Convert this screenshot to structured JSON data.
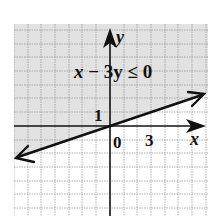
{
  "graph": {
    "inequality": "x − 3y ≤ 0",
    "inequality_parts": {
      "x": "x",
      "minus": "−",
      "three_y": "3y",
      "leq": "≤",
      "zero": "0"
    },
    "axis_labels": {
      "x": "x",
      "y": "y"
    },
    "tick_labels": {
      "origin": "0",
      "x_tick": "3",
      "y_tick": "1"
    },
    "boundary_line": {
      "equation": "y = x/3",
      "style": "solid",
      "through": [
        [
          0,
          0
        ],
        [
          3,
          1
        ]
      ]
    },
    "shaded_region": "above line (y ≥ x/3)",
    "colors": {
      "shade": "#e4e4e4",
      "grid": "#9a9a9a",
      "axis": "#111111",
      "line": "#111111"
    }
  }
}
